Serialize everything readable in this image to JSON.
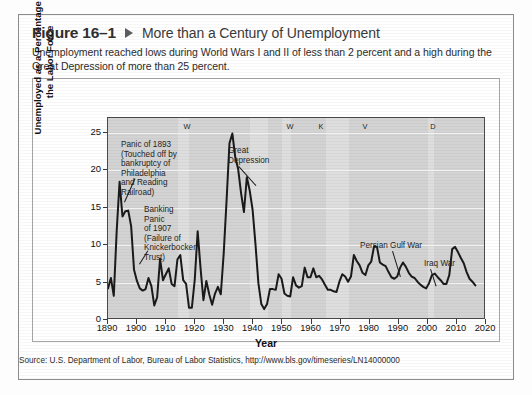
{
  "figure": {
    "number": "Figure 16–1",
    "marker_icon": "triangle-right-icon",
    "title": "More than a Century of Unemployment",
    "subtitle": "Unemployment reached lows during World Wars I and II of less than 2 percent and a high during the Great Depression of more than 25 percent.",
    "source": "Source: U.S. Department of Labor, Bureau of Labor Statistics, http://www.bls.gov/timeseries/LN14000000"
  },
  "chart_data": {
    "type": "line",
    "title": "More than a Century of Unemployment",
    "xlabel": "Year",
    "ylabel": "Unemployed as a Percentage of the Labor Force",
    "xlim": [
      1890,
      2020
    ],
    "ylim": [
      0,
      27
    ],
    "grid": true,
    "legend": "none",
    "xticks": [
      1890,
      1900,
      1910,
      1920,
      1930,
      1940,
      1950,
      1960,
      1970,
      1980,
      1990,
      2000,
      2010,
      2020
    ],
    "yticks": [
      0,
      5,
      10,
      15,
      20,
      25
    ],
    "series": [
      {
        "name": "Unemployment rate",
        "x": [
          1890,
          1891,
          1892,
          1893,
          1894,
          1895,
          1896,
          1897,
          1898,
          1899,
          1900,
          1901,
          1902,
          1903,
          1904,
          1905,
          1906,
          1907,
          1908,
          1909,
          1910,
          1911,
          1912,
          1913,
          1914,
          1915,
          1916,
          1917,
          1918,
          1919,
          1920,
          1921,
          1922,
          1923,
          1924,
          1925,
          1926,
          1927,
          1928,
          1929,
          1930,
          1931,
          1932,
          1933,
          1934,
          1935,
          1936,
          1937,
          1938,
          1939,
          1940,
          1941,
          1942,
          1943,
          1944,
          1945,
          1946,
          1947,
          1948,
          1949,
          1950,
          1951,
          1952,
          1953,
          1954,
          1955,
          1956,
          1957,
          1958,
          1959,
          1960,
          1961,
          1962,
          1963,
          1964,
          1965,
          1966,
          1967,
          1968,
          1969,
          1970,
          1971,
          1972,
          1973,
          1974,
          1975,
          1976,
          1977,
          1978,
          1979,
          1980,
          1981,
          1982,
          1983,
          1984,
          1985,
          1986,
          1987,
          1988,
          1989,
          1990,
          1991,
          1992,
          1993,
          1994,
          1995,
          1996,
          1997,
          1998,
          1999,
          2000,
          2001,
          2002,
          2003,
          2004,
          2005,
          2006,
          2007,
          2008,
          2009,
          2010,
          2011,
          2012,
          2013,
          2014,
          2015,
          2016,
          2017
        ],
        "values": [
          4.0,
          5.4,
          3.0,
          11.7,
          18.4,
          13.7,
          14.4,
          14.5,
          12.4,
          6.5,
          5.0,
          4.0,
          3.7,
          3.9,
          5.4,
          4.3,
          1.7,
          2.8,
          8.0,
          5.1,
          5.9,
          6.7,
          4.6,
          4.3,
          7.9,
          8.5,
          5.1,
          4.6,
          1.4,
          1.4,
          5.2,
          11.7,
          6.7,
          2.4,
          5.0,
          3.2,
          1.8,
          3.3,
          4.2,
          3.2,
          8.7,
          15.9,
          23.6,
          24.9,
          21.7,
          20.1,
          16.9,
          14.3,
          19.0,
          17.2,
          14.6,
          9.9,
          4.7,
          1.9,
          1.2,
          1.9,
          3.9,
          3.9,
          3.8,
          5.9,
          5.3,
          3.3,
          3.0,
          2.9,
          5.5,
          4.4,
          4.1,
          4.3,
          6.8,
          5.5,
          5.5,
          6.7,
          5.5,
          5.7,
          5.2,
          4.5,
          3.8,
          3.8,
          3.6,
          3.5,
          4.9,
          5.9,
          5.6,
          4.9,
          5.6,
          8.5,
          7.7,
          7.1,
          6.1,
          5.8,
          7.1,
          7.6,
          9.7,
          9.6,
          7.5,
          7.2,
          7.0,
          6.2,
          5.5,
          5.3,
          5.6,
          6.8,
          7.5,
          6.9,
          6.1,
          5.6,
          5.4,
          4.9,
          4.5,
          4.2,
          4.0,
          4.7,
          5.8,
          6.0,
          5.5,
          5.1,
          4.6,
          4.6,
          5.8,
          9.3,
          9.6,
          8.9,
          8.1,
          7.4,
          6.2,
          5.3,
          4.9,
          4.4
        ]
      }
    ],
    "shaded_bands": [
      {
        "label": "WORLD WAR I",
        "start": 1914,
        "end": 1918
      },
      {
        "label": "WORLD WAR II",
        "start": 1939,
        "end": 1945
      },
      {
        "label": "KOREAN WAR",
        "start": 1950,
        "end": 1953
      },
      {
        "label": "VIETNAM WAR",
        "start": 1965,
        "end": 1973
      },
      {
        "label": "DOT-COM MELTDOWN",
        "start": 2000,
        "end": 2002
      }
    ],
    "band_labels": [
      "WORLD WAR I",
      "WORLD WAR II",
      "KOREAN WAR",
      "VIETNAM WAR",
      "DOT•COM MELTDOWN"
    ],
    "annotations": [
      {
        "name": "panic-1893",
        "text": "Panic of 1893\n(Touched off by\nbankruptcy of\nPhiladelphia\nand Reading\nRailroad)",
        "points_to_year": 1894,
        "points_to_value": 18.4
      },
      {
        "name": "banking-panic-1907",
        "text": "Banking\nPanic\nof 1907\n(Failure of\nKnickerbocker\nTrust)",
        "points_to_year": 1908,
        "points_to_value": 8.0
      },
      {
        "name": "great-depression",
        "text": "Great\nDepression",
        "points_to_year": 1933,
        "points_to_value": 24.9
      },
      {
        "name": "persian-gulf-war",
        "text": "Persian Gulf War",
        "points_to_year": 1991,
        "points_to_value": 6.8
      },
      {
        "name": "iraq-war",
        "text": "Iraq War",
        "points_to_year": 2003,
        "points_to_value": 6.0
      }
    ]
  },
  "annotation_lines": {
    "panic_1893": [
      "Panic of 1893",
      "(Touched off by",
      "bankruptcy of",
      "Philadelphia",
      "and Reading",
      "Railroad)"
    ],
    "banking_1907": [
      "Banking",
      "Panic",
      "of 1907",
      "(Failure of",
      "Knickerbocker",
      "Trust)"
    ],
    "great_depression": [
      "Great",
      "Depression"
    ],
    "persian_gulf": [
      "Persian Gulf War"
    ],
    "iraq_war": [
      "Iraq War"
    ]
  },
  "colors": {
    "plot_background": "#d3d3d3",
    "band_background": "#dedede",
    "line": "#1a1a1a",
    "gridline": "#f2f2f2",
    "frame": "#a6a6a6",
    "text": "#1f1f1f"
  }
}
